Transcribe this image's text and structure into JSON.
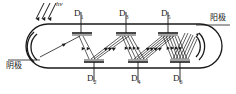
{
  "figure": {
    "type": "photomultiplier-tube-schematic",
    "domain": "physics-diagram",
    "stroke_color": "#1a1a1a",
    "background_color": "#ffffff"
  },
  "labels": {
    "incident_light": "hν",
    "cathode": "阴极",
    "anode": "阳极"
  },
  "dynodes": {
    "top": [
      {
        "id": "D1",
        "letter": "D",
        "sub": "1",
        "x": 74,
        "y": 14
      },
      {
        "id": "D3",
        "letter": "D",
        "sub": "3",
        "x": 120,
        "y": 14
      },
      {
        "id": "D5",
        "letter": "D",
        "sub": "5",
        "x": 163,
        "y": 14
      }
    ],
    "bottom": [
      {
        "id": "D2",
        "letter": "D",
        "sub": "2",
        "x": 86,
        "y": 76
      },
      {
        "id": "D4",
        "letter": "D",
        "sub": "4",
        "x": 131,
        "y": 76
      },
      {
        "id": "D6",
        "letter": "D",
        "sub": "6",
        "x": 173,
        "y": 76
      }
    ]
  },
  "annotations": {
    "cathode_position": "left-end-arc",
    "anode_position": "right-end-arc",
    "beam_description": "electron-cascade-zigzag"
  }
}
